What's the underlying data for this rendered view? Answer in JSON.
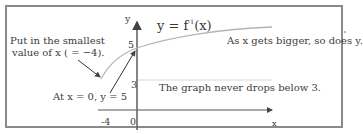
{
  "figure": {
    "title_prefix": "y = f",
    "title_sup": "-1",
    "title_suffix": "(x)",
    "axes": {
      "x_label": "x",
      "y_label": "y",
      "ticks": {
        "y_5": "5",
        "y_3": "3",
        "x_neg4": "-4",
        "origin": "0"
      }
    },
    "annotations": {
      "smallest_line1": "Put in the smallest",
      "smallest_line2": "value of x ( = −4).",
      "at_zero": "At x = 0, y = 5",
      "increasing": "As x gets bigger, so does y.",
      "never_below": "The graph never drops below 3."
    },
    "colors": {
      "frame": "#8a8a8a",
      "axis": "#555555",
      "curve": "#b5b5b5",
      "asymptote": "#d8d8d8",
      "text": "#3c3c3c"
    }
  }
}
